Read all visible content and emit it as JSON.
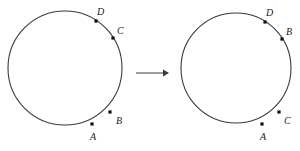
{
  "figure": {
    "type": "geometry-diagram",
    "stroke_color": "#3a3a3a",
    "dot_color": "#111111",
    "label_color": "#1a1a1a",
    "background": "#ffffff"
  },
  "arrow": {
    "name": "transformation-arrow",
    "direction": "right",
    "x1": 136,
    "y1": 73,
    "x2": 166,
    "y2": 73
  },
  "circles": [
    {
      "id": "left-circle",
      "cx": 65,
      "cy": 68,
      "r": 57,
      "points": [
        {
          "label": "D",
          "dot_x": 96,
          "dot_y": 21,
          "label_x": 97,
          "label_y": 7,
          "angle_deg": -56
        },
        {
          "label": "C",
          "dot_x": 113,
          "dot_y": 38,
          "label_x": 117,
          "label_y": 26,
          "angle_deg": -28
        },
        {
          "label": "B",
          "dot_x": 110,
          "dot_y": 112,
          "label_x": 116,
          "label_y": 116,
          "angle_deg": 51
        },
        {
          "label": "A",
          "dot_x": 92,
          "dot_y": 124,
          "label_x": 90,
          "label_y": 132,
          "angle_deg": 70
        }
      ]
    },
    {
      "id": "right-circle",
      "cx": 236,
      "cy": 68,
      "r": 55,
      "points": [
        {
          "label": "D",
          "dot_x": 265,
          "dot_y": 22,
          "label_x": 266,
          "label_y": 8,
          "angle_deg": -56
        },
        {
          "label": "B",
          "dot_x": 282,
          "dot_y": 39,
          "label_x": 286,
          "label_y": 27,
          "angle_deg": -28
        },
        {
          "label": "C",
          "dot_x": 279,
          "dot_y": 112,
          "label_x": 284,
          "label_y": 116,
          "angle_deg": 51
        },
        {
          "label": "A",
          "dot_x": 262,
          "dot_y": 124,
          "label_x": 260,
          "label_y": 132,
          "angle_deg": 70
        }
      ]
    }
  ]
}
